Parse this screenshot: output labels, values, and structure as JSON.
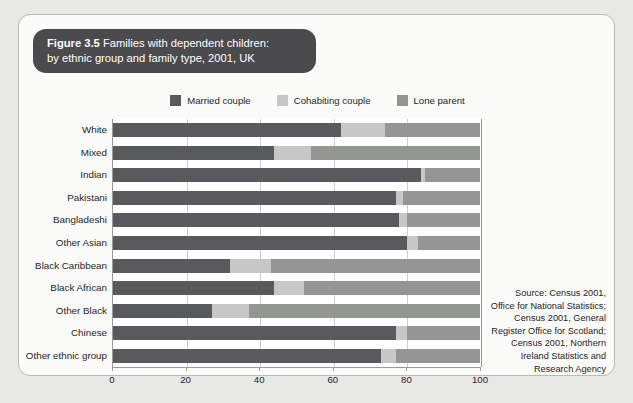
{
  "figure": {
    "number": "Figure 3.5",
    "title": " Families with dependent children:",
    "subtitle": "by ethnic group and family type, 2001, UK"
  },
  "source_note": "Source: Census 2001, Office for National Statistics; Census 2001, General Register Office for Scotland; Census 2001, Northern Ireland Statistics and Research Agency",
  "colors": {
    "married": "#585a5c",
    "cohabiting": "#c6c7c6",
    "lone": "#949693",
    "panel_background": "#fbfbfa",
    "page_background": "#e8e8e6",
    "title_pill": "#4b4b4d",
    "plot_background": "#ffffff",
    "gridline": "#cfcfcd",
    "axis": "#9a9a98"
  },
  "chart_data": {
    "type": "bar",
    "orientation": "horizontal",
    "stacked": true,
    "title": "Figure 3.5 Families with dependent children: by ethnic group and family type, 2001, UK",
    "xlabel": "",
    "ylabel": "",
    "xlim": [
      0,
      100
    ],
    "xticks": [
      0,
      20,
      40,
      60,
      80,
      100
    ],
    "xticklabels": [
      "0",
      "20",
      "40",
      "60",
      "80",
      "100"
    ],
    "grid": true,
    "legend_position": "top-center",
    "categories": [
      "White",
      "Mixed",
      "Indian",
      "Pakistani",
      "Bangladeshi",
      "Other Asian",
      "Black Caribbean",
      "Black African",
      "Other Black",
      "Chinese",
      "Other ethnic group"
    ],
    "series": [
      {
        "name": "Married couple",
        "color": "#585a5c",
        "values": [
          62,
          44,
          84,
          77,
          78,
          80,
          32,
          44,
          27,
          77,
          73
        ]
      },
      {
        "name": "Cohabiting couple",
        "color": "#c6c7c6",
        "values": [
          12,
          10,
          1,
          2,
          2,
          3,
          11,
          8,
          10,
          3,
          4
        ]
      },
      {
        "name": "Lone parent",
        "color": "#949693",
        "values": [
          26,
          46,
          15,
          21,
          20,
          17,
          57,
          48,
          63,
          20,
          23
        ]
      }
    ]
  }
}
